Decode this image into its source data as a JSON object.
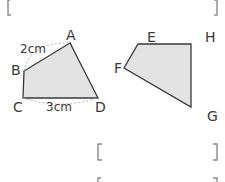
{
  "colors": {
    "shape_fill": "#e3e3e3",
    "shape_stroke": "#3a3a3a",
    "bracket": "#8a8a8a",
    "text": "#3a3a3a",
    "dashed": "#aaaaaa"
  },
  "figure_left": {
    "name": "quadrilateral ABCD",
    "vertices": {
      "A": {
        "label": "A",
        "x": 70,
        "y": 43
      },
      "B": {
        "label": "B",
        "x": 24,
        "y": 71
      },
      "C": {
        "label": "C",
        "x": 23,
        "y": 98
      },
      "D": {
        "label": "D",
        "x": 98,
        "y": 98
      }
    },
    "measures": {
      "AB": "2cm",
      "CD": "3cm"
    }
  },
  "figure_right": {
    "name": "quadrilateral EFGH",
    "vertices": {
      "E": {
        "label": "E",
        "x": 138,
        "y": 44
      },
      "F": {
        "label": "F",
        "x": 124,
        "y": 68
      },
      "G": {
        "label": "G",
        "x": 191,
        "y": 107
      },
      "H": {
        "label": "H",
        "x": 191,
        "y": 44
      }
    }
  },
  "answer_brackets": [
    {
      "open": "[",
      "close": "]",
      "position": "top"
    },
    {
      "open": "[",
      "close": "]",
      "position": "middle"
    },
    {
      "open": "[",
      "close": "]",
      "position": "bottom-partial"
    }
  ]
}
